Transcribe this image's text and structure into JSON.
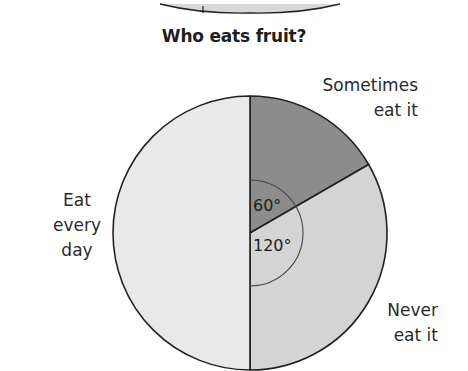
{
  "chart_data": {
    "type": "pie",
    "title": "Who eats fruit?",
    "slices": [
      {
        "label": "Sometimes eat it",
        "angle_deg": 60,
        "fraction": 0.1667,
        "color": "#8c8c8c"
      },
      {
        "label": "Never eat it",
        "angle_deg": 120,
        "fraction": 0.3333,
        "color": "#d4d4d4"
      },
      {
        "label": "Eat every day",
        "angle_deg": 180,
        "fraction": 0.5,
        "color": "#e9e9e9"
      }
    ],
    "angle_annotations": [
      "60°",
      "120°"
    ],
    "start_angle": "top, clockwise"
  },
  "title": "Who eats fruit?",
  "labels": {
    "sometimes": [
      "Sometimes",
      "eat it"
    ],
    "never": [
      "Never",
      "eat it"
    ],
    "every_day": [
      "Eat",
      "every",
      "day"
    ]
  },
  "angles": {
    "a60": "60°",
    "a120": "120°"
  },
  "colors": {
    "sometimes": "#8c8c8c",
    "never": "#d4d4d4",
    "every_day": "#e9e9e9",
    "stroke": "#222222"
  }
}
